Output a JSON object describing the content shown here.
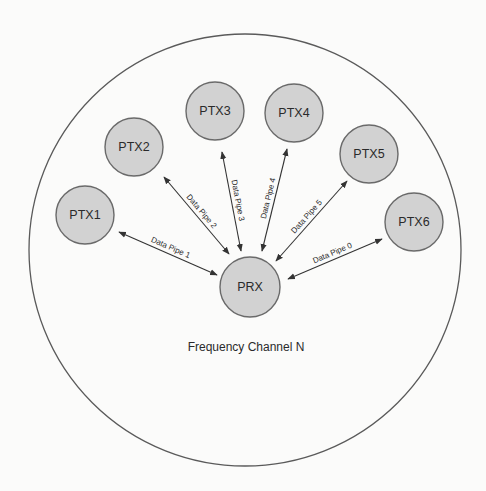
{
  "diagram": {
    "channel": {
      "label": "Frequency Channel N",
      "cx": 245,
      "cy": 250,
      "r": 216,
      "label_x": 246,
      "label_y": 351
    },
    "receiver": {
      "id": "PRX",
      "label": "PRX",
      "cx": 250,
      "cy": 287,
      "r": 30
    },
    "transmitters": [
      {
        "id": "PTX1",
        "label": "PTX1",
        "cx": 85,
        "cy": 215,
        "r": 29
      },
      {
        "id": "PTX2",
        "label": "PTX2",
        "cx": 134,
        "cy": 147,
        "r": 29
      },
      {
        "id": "PTX3",
        "label": "PTX3",
        "cx": 215,
        "cy": 111,
        "r": 29
      },
      {
        "id": "PTX4",
        "label": "PTX4",
        "cx": 294,
        "cy": 113,
        "r": 29
      },
      {
        "id": "PTX5",
        "label": "PTX5",
        "cx": 369,
        "cy": 154,
        "r": 29
      },
      {
        "id": "PTX6",
        "label": "PTX6",
        "cx": 414,
        "cy": 222,
        "r": 29
      }
    ],
    "pipes": [
      {
        "label": "Data Pipe 1",
        "from": "PTX1",
        "to": "PRX",
        "x1": 119,
        "y1": 232,
        "x2": 217,
        "y2": 275
      },
      {
        "label": "Data Pipe 2",
        "from": "PTX2",
        "to": "PRX",
        "x1": 164,
        "y1": 177,
        "x2": 229,
        "y2": 254
      },
      {
        "label": "Data Pipe 3",
        "from": "PTX3",
        "to": "PRX",
        "x1": 222,
        "y1": 152,
        "x2": 241,
        "y2": 251
      },
      {
        "label": "Data Pipe 4",
        "from": "PTX4",
        "to": "PRX",
        "x1": 287,
        "y1": 149,
        "x2": 262,
        "y2": 251
      },
      {
        "label": "Data Pipe 5",
        "from": "PTX5",
        "to": "PRX",
        "x1": 347,
        "y1": 181,
        "x2": 276,
        "y2": 261
      },
      {
        "label": "Data Pipe 0",
        "from": "PTX6",
        "to": "PRX",
        "x1": 382,
        "y1": 239,
        "x2": 288,
        "y2": 279
      }
    ]
  }
}
